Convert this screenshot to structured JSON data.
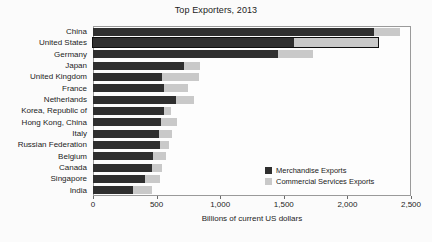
{
  "chart_data": {
    "type": "bar",
    "orientation": "horizontal",
    "stacked": true,
    "title": "Top Exporters, 2013",
    "xlabel": "Billions of current US dollars",
    "ylabel": "",
    "xlim": [
      0,
      2500
    ],
    "xticks": [
      0,
      500,
      1000,
      1500,
      2000,
      2500
    ],
    "xticklabels": [
      "0",
      "500",
      "1,000",
      "1,500",
      "2,000",
      "2,500"
    ],
    "grid": false,
    "legend_position": "inside-bottom-right",
    "categories": [
      "China",
      "United States",
      "Germany",
      "Japan",
      "United Kingdom",
      "France",
      "Netherlands",
      "Korea, Republic of",
      "Hong Kong, China",
      "Italy",
      "Russian Federation",
      "Belgium",
      "Canada",
      "Singapore",
      "India"
    ],
    "series": [
      {
        "name": "Merchandise Exports",
        "color": "#2f2f2f",
        "values": [
          2209,
          1580,
          1453,
          715,
          542,
          560,
          655,
          560,
          535,
          515,
          525,
          470,
          460,
          410,
          315
        ]
      },
      {
        "name": "Commercial Services Exports",
        "color": "#c9c9c9",
        "values": [
          205,
          662,
          275,
          130,
          295,
          185,
          140,
          55,
          125,
          110,
          70,
          100,
          80,
          120,
          150
        ]
      }
    ],
    "highlighted_category": "United States",
    "highlight_outline_color": "#0e0e0e"
  },
  "legend": {
    "items": [
      {
        "label": "Merchandise Exports",
        "color": "#2f2f2f"
      },
      {
        "label": "Commercial Services Exports",
        "color": "#c9c9c9"
      }
    ]
  }
}
